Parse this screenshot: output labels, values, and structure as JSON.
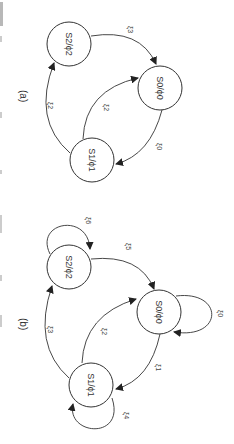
{
  "figure": {
    "rotation": "90deg-clockwise",
    "caption_partial": "FIG 3. ...",
    "panels": [
      {
        "label": "(a)",
        "nodes": [
          {
            "id": "S0",
            "label": "S0/ϕ0"
          },
          {
            "id": "S1",
            "label": "S1/ϕ1"
          },
          {
            "id": "S2",
            "label": "S2/ϕ2"
          }
        ],
        "edges": [
          {
            "from": "S0",
            "to": "S1",
            "label": "ξ0"
          },
          {
            "from": "S1",
            "to": "S0",
            "label": "ξ2"
          },
          {
            "from": "S1",
            "to": "S2",
            "label": "ξ2"
          },
          {
            "from": "S2",
            "to": "S0",
            "label": "ξ3"
          }
        ]
      },
      {
        "label": "(b)",
        "nodes": [
          {
            "id": "S0",
            "label": "S0/ϕ0"
          },
          {
            "id": "S1",
            "label": "S1/ϕ1"
          },
          {
            "id": "S2",
            "label": "S2/ϕ2"
          }
        ],
        "edges": [
          {
            "from": "S0",
            "to": "S0",
            "label": "ξ0"
          },
          {
            "from": "S0",
            "to": "S1",
            "label": "ξ1"
          },
          {
            "from": "S1",
            "to": "S0",
            "label": "ξ2"
          },
          {
            "from": "S1",
            "to": "S2",
            "label": "ξ3"
          },
          {
            "from": "S1",
            "to": "S1",
            "label": "ξ4"
          },
          {
            "from": "S2",
            "to": "S0",
            "label": "ξ5"
          },
          {
            "from": "S2",
            "to": "S2",
            "label": "ξ6"
          }
        ]
      }
    ]
  },
  "labels": {
    "a": "(a)",
    "b": "(b)",
    "S0": "S0/ϕ0",
    "S1": "S1/ϕ1",
    "S2": "S2/ϕ2",
    "xi0": "ξ0",
    "xi1": "ξ1",
    "xi2": "ξ2",
    "xi3": "ξ3",
    "xi4": "ξ4",
    "xi5": "ξ5",
    "xi6": "ξ6"
  }
}
